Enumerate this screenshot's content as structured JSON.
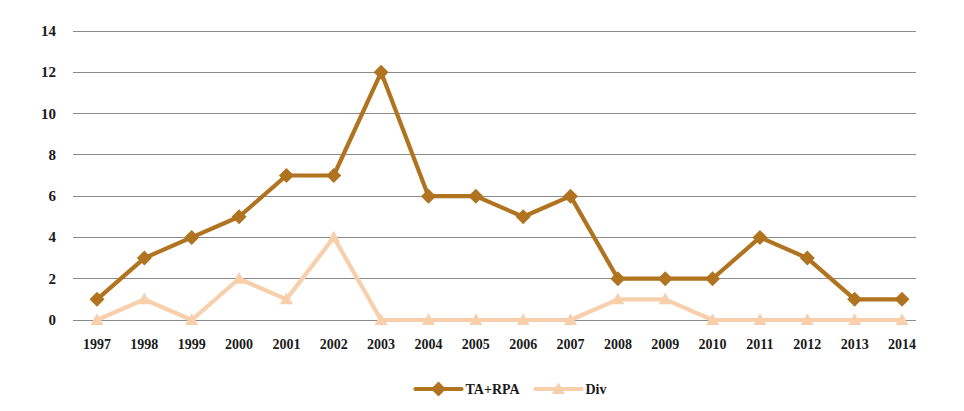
{
  "chart_data": {
    "type": "line",
    "title": "",
    "subtitle": "",
    "xlabel": "",
    "ylabel": "",
    "x": [
      "1997",
      "1998",
      "1999",
      "2000",
      "2001",
      "2002",
      "2003",
      "2004",
      "2005",
      "2006",
      "2007",
      "2008",
      "2009",
      "2010",
      "2011",
      "2012",
      "2013",
      "2014"
    ],
    "categories": [
      "1997",
      "1998",
      "1999",
      "2000",
      "2001",
      "2002",
      "2003",
      "2004",
      "2005",
      "2006",
      "2007",
      "2008",
      "2009",
      "2010",
      "2011",
      "2012",
      "2013",
      "2014"
    ],
    "series": [
      {
        "name": "TA+RPA",
        "color": "#b0731f",
        "marker": "diamond",
        "values": [
          1,
          3,
          4,
          5,
          7,
          7,
          12,
          6,
          6,
          5,
          6,
          2,
          2,
          2,
          4,
          3,
          1,
          1
        ]
      },
      {
        "name": "Div",
        "color": "#f7cfab",
        "marker": "triangle",
        "values": [
          0,
          1,
          0,
          2,
          1,
          4,
          0,
          0,
          0,
          0,
          0,
          1,
          1,
          0,
          0,
          0,
          0,
          0
        ]
      }
    ],
    "ylim": [
      0,
      14
    ],
    "yticks": [
      "0",
      "2",
      "4",
      "6",
      "8",
      "10",
      "12",
      "14"
    ],
    "ytick_values": [
      0,
      2,
      4,
      6,
      8,
      10,
      12,
      14
    ],
    "xtick_labels": [
      "1997",
      "1998",
      "1999",
      "2000",
      "2001",
      "2002",
      "2003",
      "2004",
      "2005",
      "2006",
      "2007",
      "2008",
      "2009",
      "2010",
      "2011",
      "2012",
      "2013",
      "2014"
    ],
    "grid": true,
    "grid_axis": "y",
    "grid_color": "#8a8a8a",
    "legend_position": "bottom",
    "legend_entries": [
      {
        "label": "TA+RPA",
        "color": "#b0731f",
        "marker": "diamond"
      },
      {
        "label": "Div",
        "color": "#f7cfab",
        "marker": "triangle"
      }
    ],
    "background_color": "#ffffff",
    "axis_label_color": "#1a1a1a"
  }
}
